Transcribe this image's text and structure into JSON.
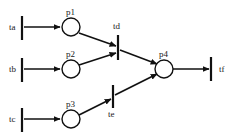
{
  "diagram": {
    "type": "petri-net",
    "title": "",
    "background_color": "#ffffff",
    "stroke_color": "#111111",
    "places": [
      {
        "id": "p1",
        "label": "p1",
        "cx": 71,
        "cy": 27,
        "r": 9,
        "label_x": 66,
        "label_y": 8
      },
      {
        "id": "p2",
        "label": "p2",
        "cx": 71,
        "cy": 69,
        "r": 9,
        "label_x": 66,
        "label_y": 50
      },
      {
        "id": "p3",
        "label": "p3",
        "cx": 71,
        "cy": 119,
        "r": 9,
        "label_x": 66,
        "label_y": 100
      },
      {
        "id": "p4",
        "label": "p4",
        "cx": 164,
        "cy": 69,
        "r": 9,
        "label_x": 159,
        "label_y": 50
      }
    ],
    "transitions": [
      {
        "id": "ta",
        "label": "ta",
        "x": 22,
        "y_top": 16,
        "y_bottom": 40,
        "label_x": 9,
        "label_y": 23
      },
      {
        "id": "tb",
        "label": "tb",
        "x": 22,
        "y_top": 58,
        "y_bottom": 82,
        "label_x": 9,
        "label_y": 65
      },
      {
        "id": "tc",
        "label": "tc",
        "x": 22,
        "y_top": 108,
        "y_bottom": 132,
        "label_x": 9,
        "label_y": 115
      },
      {
        "id": "td",
        "label": "td",
        "x": 118,
        "y_top": 35,
        "y_bottom": 60,
        "label_x": 113,
        "label_y": 22
      },
      {
        "id": "te",
        "label": "te",
        "x": 113,
        "y_top": 85,
        "y_bottom": 108,
        "label_x": 108,
        "label_y": 110
      },
      {
        "id": "tf",
        "label": "tf",
        "x": 211,
        "y_top": 57,
        "y_bottom": 81,
        "label_x": 219,
        "label_y": 65
      }
    ],
    "arcs": [
      {
        "from": "ta",
        "to": "p1",
        "x1": 24,
        "y1": 27,
        "x2": 60,
        "y2": 27
      },
      {
        "from": "tb",
        "to": "p2",
        "x1": 24,
        "y1": 69,
        "x2": 60,
        "y2": 69
      },
      {
        "from": "tc",
        "to": "p3",
        "x1": 24,
        "y1": 119,
        "x2": 60,
        "y2": 119
      },
      {
        "from": "p1",
        "to": "td",
        "x1": 79,
        "y1": 33,
        "x2": 116,
        "y2": 46
      },
      {
        "from": "p2",
        "to": "td",
        "x1": 79,
        "y1": 65,
        "x2": 116,
        "y2": 53
      },
      {
        "from": "td",
        "to": "p4",
        "x1": 120,
        "y1": 50,
        "x2": 156,
        "y2": 64
      },
      {
        "from": "p3",
        "to": "te",
        "x1": 79,
        "y1": 115,
        "x2": 111,
        "y2": 99
      },
      {
        "from": "te",
        "to": "p4",
        "x1": 115,
        "y1": 95,
        "x2": 156,
        "y2": 74
      },
      {
        "from": "p4",
        "to": "tf",
        "x1": 173,
        "y1": 69,
        "x2": 209,
        "y2": 69
      }
    ]
  }
}
